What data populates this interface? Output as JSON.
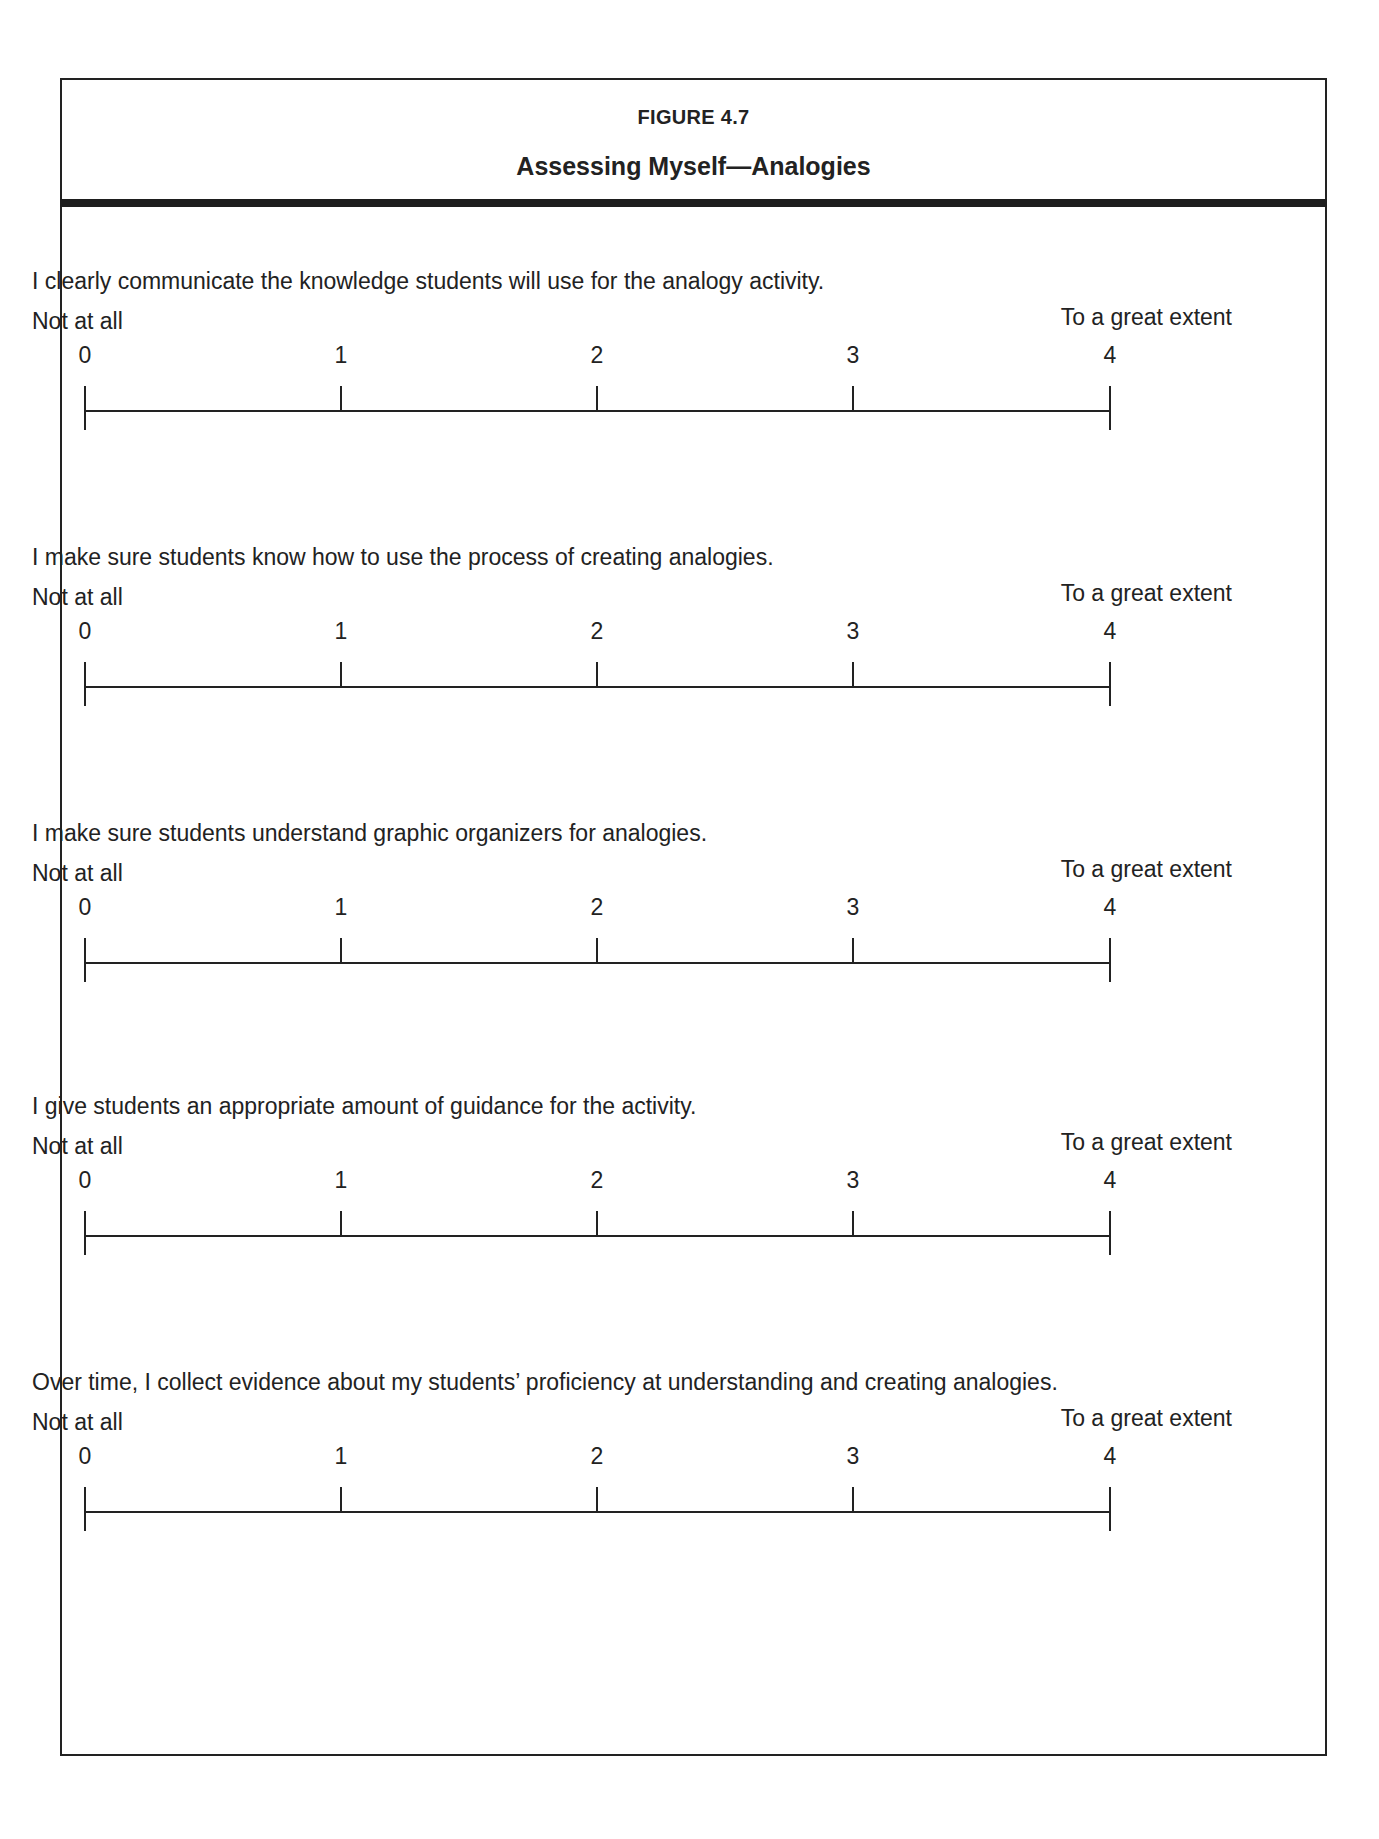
{
  "figure": {
    "label": "FIGURE 4.7",
    "title": "Assessing Myself—Analogies"
  },
  "scale": {
    "low_label": "Not at all",
    "high_label": "To a great extent",
    "values": [
      "0",
      "1",
      "2",
      "3",
      "4"
    ]
  },
  "items": [
    {
      "prompt": "I clearly communicate the knowledge students will use for the analogy activity."
    },
    {
      "prompt": "I make sure students know how to use the process of creating analogies."
    },
    {
      "prompt": "I make sure students understand graphic organizers for analogies."
    },
    {
      "prompt": "I give students an appropriate amount of guidance for the activity."
    },
    {
      "prompt": "Over time, I collect evidence about my students’ proficiency at understanding and creating analogies."
    }
  ]
}
